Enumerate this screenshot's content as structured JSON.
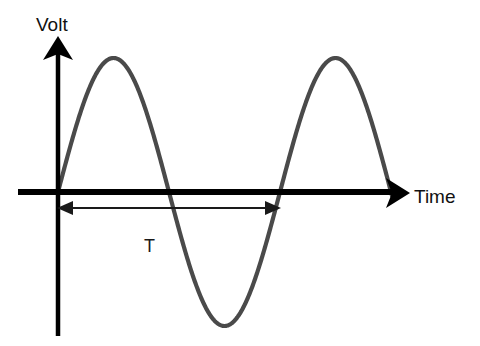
{
  "figure": {
    "background_color": "#ffffff"
  },
  "labels": {
    "y_axis": "Volt",
    "x_axis": "Time",
    "period": "T"
  },
  "colors": {
    "axis": "#000000",
    "curve": "#4a4a4a",
    "text": "#111111",
    "period_arrow": "#1a1a1a"
  },
  "chart_data": {
    "type": "line",
    "title": "",
    "xlabel": "Time",
    "ylabel": "Volt",
    "grid": false,
    "legend": null,
    "annotations": [
      {
        "label": "T",
        "meaning": "period",
        "arrow": "double-headed",
        "from_x": 58,
        "to_x": 280,
        "y": 208
      }
    ],
    "axes": {
      "origin_x": 58,
      "origin_y": 192,
      "x_axis_start_x": 18,
      "x_axis_end_x": 400,
      "y_axis_top_y": 36,
      "y_axis_bottom_y": 336
    },
    "series": [
      {
        "name": "voltage",
        "waveform": "sine",
        "amplitude": 134,
        "period_px": 222,
        "phase": 0,
        "start_x": 58,
        "end_x": 392,
        "cycles": 1.5,
        "peaks": [
          {
            "x": 112,
            "y": 58
          },
          {
            "x": 332,
            "y": 58
          }
        ],
        "troughs": [
          {
            "x": 222,
            "y": 325
          }
        ],
        "zero_crossings": [
          58,
          165,
          280,
          388
        ]
      }
    ]
  }
}
